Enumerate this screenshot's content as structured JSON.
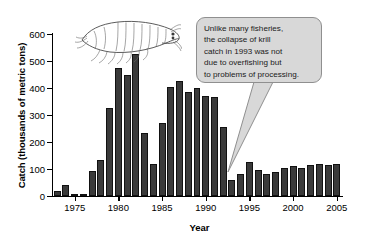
{
  "chart_data": {
    "type": "bar",
    "title": "",
    "xlabel": "Year",
    "ylabel": "Catch (thousands of metric tons)",
    "ylim": [
      0,
      600
    ],
    "yticks": [
      0,
      100,
      200,
      300,
      400,
      500,
      600
    ],
    "ytick_labels": [
      "0",
      "100",
      "200",
      "300",
      "400",
      "500",
      "600"
    ],
    "xlim": [
      1972.4,
      2005.6
    ],
    "xticks": [
      1975,
      1980,
      1985,
      1990,
      1995,
      2000,
      2005
    ],
    "xtick_labels": [
      "1975",
      "1980",
      "1985",
      "1990",
      "1995",
      "2000",
      "2005"
    ],
    "grid": false,
    "legend": "none",
    "bar_color": "#3a3a3a",
    "categories": [
      1973,
      1974,
      1975,
      1976,
      1977,
      1978,
      1979,
      1980,
      1981,
      1982,
      1983,
      1984,
      1985,
      1986,
      1987,
      1988,
      1989,
      1990,
      1991,
      1992,
      1993,
      1994,
      1995,
      1996,
      1997,
      1998,
      1999,
      2000,
      2001,
      2002,
      2003,
      2004,
      2005
    ],
    "values": [
      18,
      42,
      8,
      0,
      92,
      135,
      325,
      475,
      447,
      525,
      235,
      120,
      270,
      405,
      425,
      385,
      400,
      372,
      365,
      255,
      58,
      82,
      125,
      95,
      80,
      88,
      102,
      113,
      105,
      115,
      120,
      115,
      120
    ],
    "annotations": [
      {
        "text": "Unlike many fisheries,\nthe collapse of krill\ncatch in 1993 was not\ndue to overfishing but\nto problems of processing.",
        "points_to_year": 1993,
        "style": "speech-balloon",
        "fill": "#d8d8d8",
        "border": "#8f8f8f"
      }
    ],
    "decorations": [
      {
        "name": "krill-illustration",
        "description": "line drawing of an Antarctic krill"
      }
    ]
  }
}
